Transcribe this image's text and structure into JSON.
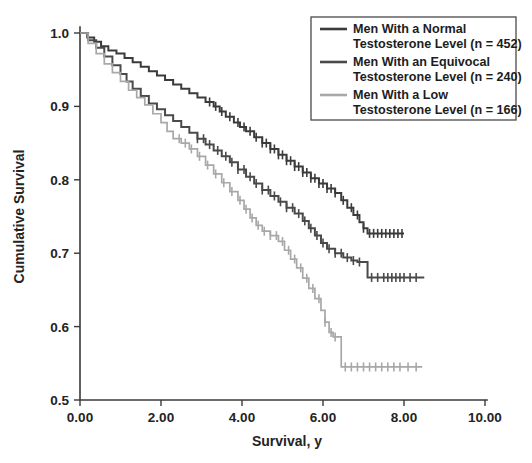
{
  "chart_data": {
    "type": "line",
    "subtype": "kaplan-meier-survival",
    "title": "",
    "xlabel": "Survival, y",
    "ylabel": "Cumulative Survival",
    "xlim": [
      0.0,
      10.0
    ],
    "ylim": [
      0.5,
      1.0
    ],
    "xticks": [
      0.0,
      2.0,
      4.0,
      6.0,
      8.0,
      10.0
    ],
    "xtick_labels": [
      "0.00",
      "2.00",
      "4.00",
      "6.00",
      "8.00",
      "10.00"
    ],
    "yticks": [
      0.5,
      0.6,
      0.7,
      0.8,
      0.9,
      1.0
    ],
    "ytick_labels": [
      "0.5",
      "0.6",
      "0.7",
      "0.8",
      "0.9",
      "1.0"
    ],
    "grid": false,
    "legend_position": "top-right",
    "censoring_marks": true,
    "series": [
      {
        "name": "Men With a Normal Testosterone Level (n = 452)",
        "group": "normal",
        "n": 452,
        "color": "#3b3b3b",
        "final_survival": 0.727,
        "points": [
          [
            0.0,
            1.0
          ],
          [
            0.18,
            0.994
          ],
          [
            0.35,
            0.988
          ],
          [
            0.52,
            0.982
          ],
          [
            0.7,
            0.976
          ],
          [
            0.9,
            0.972
          ],
          [
            1.1,
            0.966
          ],
          [
            1.3,
            0.96
          ],
          [
            1.5,
            0.954
          ],
          [
            1.7,
            0.948
          ],
          [
            1.9,
            0.942
          ],
          [
            2.1,
            0.936
          ],
          [
            2.3,
            0.93
          ],
          [
            2.5,
            0.924
          ],
          [
            2.7,
            0.918
          ],
          [
            2.9,
            0.912
          ],
          [
            3.1,
            0.906
          ],
          [
            3.3,
            0.9
          ],
          [
            3.45,
            0.893
          ],
          [
            3.6,
            0.886
          ],
          [
            3.8,
            0.878
          ],
          [
            3.95,
            0.872
          ],
          [
            4.1,
            0.866
          ],
          [
            4.3,
            0.858
          ],
          [
            4.5,
            0.85
          ],
          [
            4.7,
            0.842
          ],
          [
            4.9,
            0.834
          ],
          [
            5.1,
            0.826
          ],
          [
            5.3,
            0.818
          ],
          [
            5.5,
            0.81
          ],
          [
            5.7,
            0.802
          ],
          [
            5.9,
            0.795
          ],
          [
            6.1,
            0.788
          ],
          [
            6.3,
            0.782
          ],
          [
            6.45,
            0.772
          ],
          [
            6.6,
            0.762
          ],
          [
            6.75,
            0.752
          ],
          [
            6.9,
            0.742
          ],
          [
            7.0,
            0.734
          ],
          [
            7.1,
            0.727
          ],
          [
            8.0,
            0.727
          ]
        ],
        "censor_times": [
          3.2,
          3.35,
          3.5,
          3.7,
          3.9,
          4.05,
          4.2,
          4.35,
          4.5,
          4.6,
          4.7,
          4.8,
          4.9,
          5.0,
          5.1,
          5.2,
          5.3,
          5.4,
          5.5,
          5.6,
          5.7,
          5.8,
          5.9,
          6.0,
          6.1,
          6.2,
          6.3,
          6.5,
          6.7,
          6.85,
          7.0,
          7.15,
          7.25,
          7.35,
          7.45,
          7.55,
          7.65,
          7.75,
          7.85,
          7.95
        ]
      },
      {
        "name": "Men With an Equivocal Testosterone Level (n = 240)",
        "group": "equivocal",
        "n": 240,
        "color": "#4a4a4a",
        "final_survival": 0.667,
        "points": [
          [
            0.0,
            1.0
          ],
          [
            0.2,
            0.99
          ],
          [
            0.4,
            0.98
          ],
          [
            0.6,
            0.968
          ],
          [
            0.8,
            0.956
          ],
          [
            1.0,
            0.944
          ],
          [
            1.15,
            0.934
          ],
          [
            1.3,
            0.924
          ],
          [
            1.5,
            0.914
          ],
          [
            1.7,
            0.904
          ],
          [
            1.9,
            0.896
          ],
          [
            2.1,
            0.888
          ],
          [
            2.3,
            0.88
          ],
          [
            2.5,
            0.872
          ],
          [
            2.7,
            0.864
          ],
          [
            2.9,
            0.856
          ],
          [
            3.1,
            0.848
          ],
          [
            3.3,
            0.84
          ],
          [
            3.5,
            0.832
          ],
          [
            3.7,
            0.824
          ],
          [
            3.9,
            0.814
          ],
          [
            4.1,
            0.804
          ],
          [
            4.3,
            0.795
          ],
          [
            4.5,
            0.786
          ],
          [
            4.7,
            0.778
          ],
          [
            4.9,
            0.77
          ],
          [
            5.1,
            0.762
          ],
          [
            5.3,
            0.754
          ],
          [
            5.5,
            0.744
          ],
          [
            5.65,
            0.734
          ],
          [
            5.8,
            0.724
          ],
          [
            5.95,
            0.714
          ],
          [
            6.1,
            0.706
          ],
          [
            6.3,
            0.7
          ],
          [
            6.5,
            0.694
          ],
          [
            6.7,
            0.69
          ],
          [
            6.85,
            0.688
          ],
          [
            7.0,
            0.688
          ],
          [
            7.1,
            0.667
          ],
          [
            8.5,
            0.667
          ]
        ],
        "censor_times": [
          2.9,
          3.05,
          3.2,
          3.4,
          3.6,
          3.75,
          3.9,
          4.05,
          4.2,
          4.35,
          4.5,
          4.65,
          4.8,
          4.95,
          5.1,
          5.25,
          5.4,
          5.55,
          5.7,
          5.85,
          6.0,
          6.15,
          6.3,
          6.45,
          6.6,
          6.75,
          6.9,
          7.2,
          7.35,
          7.5,
          7.6,
          7.7,
          7.8,
          7.9,
          8.0,
          8.15,
          8.3
        ]
      },
      {
        "name": "Men With a Low Testosterone Level (n = 166)",
        "group": "low",
        "n": 166,
        "color": "#a8a8a8",
        "final_survival": 0.545,
        "points": [
          [
            0.0,
            1.0
          ],
          [
            0.2,
            0.986
          ],
          [
            0.4,
            0.972
          ],
          [
            0.6,
            0.958
          ],
          [
            0.8,
            0.946
          ],
          [
            1.0,
            0.934
          ],
          [
            1.2,
            0.922
          ],
          [
            1.4,
            0.912
          ],
          [
            1.6,
            0.902
          ],
          [
            1.8,
            0.89
          ],
          [
            2.0,
            0.878
          ],
          [
            2.15,
            0.866
          ],
          [
            2.3,
            0.856
          ],
          [
            2.5,
            0.85
          ],
          [
            2.7,
            0.842
          ],
          [
            2.9,
            0.832
          ],
          [
            3.1,
            0.82
          ],
          [
            3.3,
            0.808
          ],
          [
            3.5,
            0.796
          ],
          [
            3.7,
            0.784
          ],
          [
            3.9,
            0.772
          ],
          [
            4.05,
            0.76
          ],
          [
            4.2,
            0.748
          ],
          [
            4.35,
            0.738
          ],
          [
            4.5,
            0.73
          ],
          [
            4.7,
            0.724
          ],
          [
            4.9,
            0.716
          ],
          [
            5.05,
            0.704
          ],
          [
            5.2,
            0.692
          ],
          [
            5.35,
            0.68
          ],
          [
            5.5,
            0.666
          ],
          [
            5.65,
            0.652
          ],
          [
            5.8,
            0.638
          ],
          [
            5.95,
            0.622
          ],
          [
            6.05,
            0.606
          ],
          [
            6.15,
            0.592
          ],
          [
            6.25,
            0.586
          ],
          [
            6.35,
            0.586
          ],
          [
            6.45,
            0.545
          ],
          [
            8.45,
            0.545
          ]
        ],
        "censor_times": [
          2.45,
          2.6,
          2.75,
          2.95,
          3.15,
          3.35,
          3.55,
          3.75,
          3.95,
          4.1,
          4.25,
          4.4,
          4.55,
          4.7,
          4.85,
          5.0,
          5.15,
          5.3,
          5.45,
          5.6,
          5.75,
          5.9,
          6.05,
          6.2,
          6.3,
          6.55,
          6.7,
          6.85,
          7.0,
          7.15,
          7.3,
          7.45,
          7.6,
          7.75,
          7.9,
          8.1,
          8.3
        ]
      }
    ]
  },
  "legend": {
    "entries": [
      {
        "line1": "Men With a Normal",
        "line2": "Testosterone Level (n = 452)",
        "color": "#3b3b3b"
      },
      {
        "line1": "Men With an Equivocal",
        "line2": "Testosterone Level (n = 240)",
        "color": "#4a4a4a"
      },
      {
        "line1": "Men With a Low",
        "line2": "Testosterone Level (n = 166)",
        "color": "#a8a8a8"
      }
    ]
  }
}
